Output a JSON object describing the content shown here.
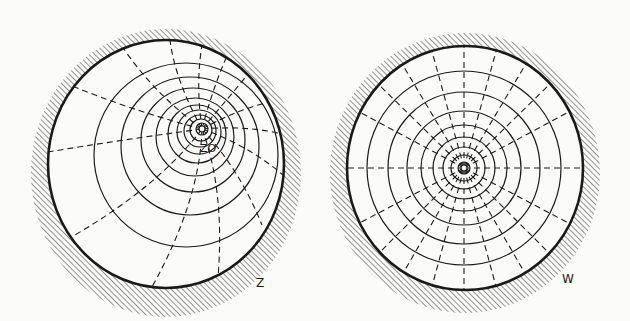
{
  "figure": {
    "panels": [
      {
        "id": "Z",
        "label": "Z",
        "point_label": "z₀",
        "point_label_text": "ZO",
        "description": "Unit disk in the Z-plane with a family of non-concentric circles accumulating at the point z0 and orthogonal dashed circular arcs through z0"
      },
      {
        "id": "W",
        "label": "W",
        "description": "Unit disk in the W-plane with concentric circles around the center and dashed radial lines"
      }
    ],
    "colors": {
      "ink": "#1a1a1a",
      "background": "#fbfbfa"
    }
  }
}
